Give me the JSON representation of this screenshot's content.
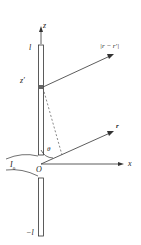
{
  "diagram": {
    "labels": {
      "z_axis": "z",
      "x_axis": "x",
      "top_end": "l",
      "bottom_end": "−l",
      "element_pos": "z′",
      "origin": "O",
      "angle": "θ",
      "current": "I",
      "current_sub": "0",
      "r_vec": "r",
      "r_diff": "|r − r′|"
    },
    "colors": {
      "line": "#333333",
      "element": "#555555",
      "dashed": "#555555"
    }
  }
}
